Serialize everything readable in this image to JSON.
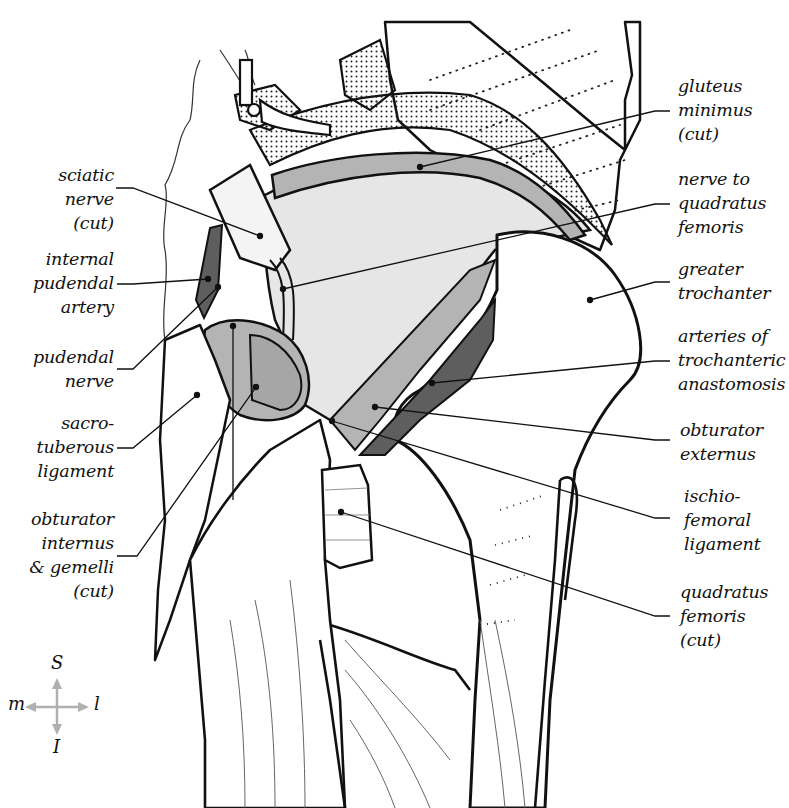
{
  "figure": {
    "type": "anatomical-illustration",
    "colors": {
      "outline": "#111111",
      "light_fill": "#e6e6e6",
      "mid_fill": "#b4b4b4",
      "dark_fill": "#5e5e5e",
      "compass_arrow": "#b0b0b0"
    }
  },
  "labels_left": [
    {
      "id": "sciatic-nerve",
      "lines": [
        "sciatic",
        "nerve",
        "(cut)"
      ]
    },
    {
      "id": "internal-pudendal-artery",
      "lines": [
        "internal",
        "pudendal",
        "artery"
      ]
    },
    {
      "id": "pudendal-nerve",
      "lines": [
        "pudendal",
        "nerve"
      ]
    },
    {
      "id": "sacrotuberous-ligament",
      "lines": [
        "sacro-",
        "tuberous",
        "ligament"
      ]
    },
    {
      "id": "obturator-internus-gemelli",
      "lines": [
        "obturator",
        "internus",
        "& gemelli",
        "(cut)"
      ]
    }
  ],
  "labels_right": [
    {
      "id": "gluteus-minimus",
      "lines": [
        "gluteus",
        "minimus",
        "(cut)"
      ]
    },
    {
      "id": "nerve-to-quadratus-femoris",
      "lines": [
        "nerve to",
        "quadratus",
        "femoris"
      ]
    },
    {
      "id": "greater-trochanter",
      "lines": [
        "greater",
        "trochanter"
      ]
    },
    {
      "id": "arteries-trochanteric-anastomosis",
      "lines": [
        "arteries of",
        "trochanteric",
        "anastomosis"
      ]
    },
    {
      "id": "obturator-externus",
      "lines": [
        "obturator",
        "externus"
      ]
    },
    {
      "id": "ischiofemoral-ligament",
      "lines": [
        "ischio-",
        "femoral",
        "ligament"
      ]
    },
    {
      "id": "quadratus-femoris",
      "lines": [
        "quadratus",
        "femoris",
        "(cut)"
      ]
    }
  ],
  "compass": {
    "superior": "S",
    "inferior": "I",
    "medial": "m",
    "lateral": "l"
  }
}
